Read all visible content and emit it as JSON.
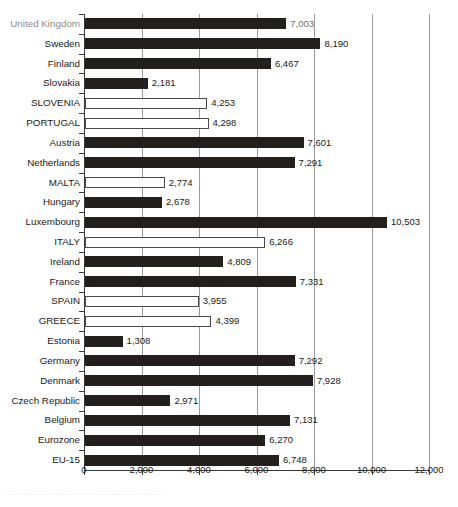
{
  "chart_data": {
    "type": "bar",
    "orientation": "horizontal",
    "title": "",
    "subtitle": "",
    "xlabel": "",
    "ylabel": "",
    "xlim": [
      0,
      12000
    ],
    "xticks": [
      0,
      2000,
      4000,
      6000,
      8000,
      10000,
      12000
    ],
    "xticklabels": [
      "0",
      "2,000",
      "4,000",
      "6,000",
      "8,000",
      "10,000",
      "12,000"
    ],
    "grid": "vertical",
    "legend": null,
    "series_styles": {
      "filled": "#231f1d",
      "open": "#ffffff"
    },
    "categories": [
      "United Kingdom",
      "Sweden",
      "Finland",
      "Slovakia",
      "SLOVENIA",
      "PORTUGAL",
      "Austria",
      "Netherlands",
      "MALTA",
      "Hungary",
      "Luxembourg",
      "ITALY",
      "Ireland",
      "France",
      "SPAIN",
      "GREECE",
      "Estonia",
      "Germany",
      "Denmark",
      "Czech Republic",
      "Belgium",
      "Eurozone",
      "EU-15"
    ],
    "values": [
      7003,
      8190,
      6467,
      2181,
      4253,
      4298,
      7601,
      7291,
      2774,
      2678,
      10503,
      6266,
      4809,
      7331,
      3955,
      4399,
      1308,
      7292,
      7928,
      2971,
      7131,
      6270,
      6748
    ],
    "value_labels": [
      "7,003",
      "8,190",
      "6,467",
      "2,181",
      "4,253",
      "4,298",
      "7,601",
      "7,291",
      "2,774",
      "2,678",
      "10,503",
      "6,266",
      "4,809",
      "7,331",
      "3,955",
      "4,399",
      "1,308",
      "7,292",
      "7,928",
      "2,971",
      "7,131",
      "6,270",
      "6,748"
    ],
    "bar_styles": [
      "filled",
      "filled",
      "filled",
      "filled",
      "open",
      "open",
      "filled",
      "filled",
      "open",
      "filled",
      "filled",
      "open",
      "filled",
      "filled",
      "open",
      "open",
      "filled",
      "filled",
      "filled",
      "filled",
      "filled",
      "filled",
      "filled"
    ]
  },
  "caption": {
    "footer_text": "................................................................"
  }
}
